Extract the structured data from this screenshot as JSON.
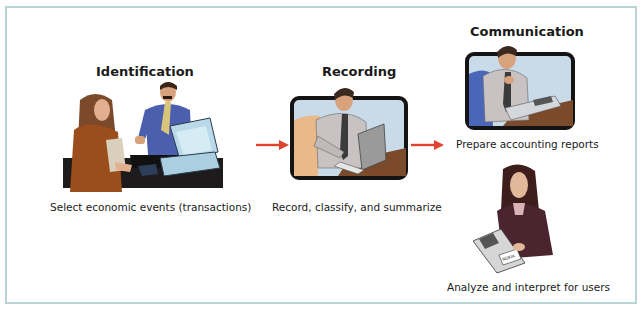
{
  "diagram": {
    "type": "process-flow",
    "steps": [
      {
        "heading": "Identification",
        "caption": "Select economic events (transactions)",
        "illustration": "customer-and-clerk-at-computer"
      },
      {
        "heading": "Recording",
        "caption": "Record, classify, and summarize",
        "illustration": "man-typing-on-laptop"
      },
      {
        "heading": "Communication",
        "captions": [
          "Prepare accounting reports",
          "Analyze and interpret for users"
        ],
        "illustrations": [
          "man-reviewing-reports",
          "woman-reading-annual-report"
        ],
        "report_label": [
          "NOKIA",
          "Annual Report"
        ]
      }
    ],
    "connectors": [
      {
        "from": "Identification",
        "to": "Recording",
        "icon": "arrow-right",
        "color": "#e0432e"
      },
      {
        "from": "Recording",
        "to": "Communication",
        "icon": "arrow-right",
        "color": "#e0432e"
      }
    ],
    "colors": {
      "border": "#b9d4d3",
      "arrow": "#e0432e",
      "text": "#1a1a1a"
    }
  }
}
